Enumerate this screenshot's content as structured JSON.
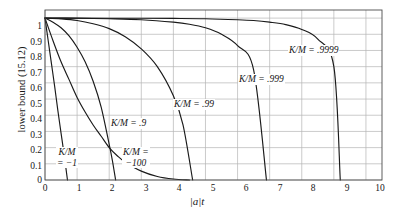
{
  "chart_data": {
    "type": "line",
    "title": "",
    "xlabel": "|a|t",
    "ylabel": "lower bound (15.12)",
    "xlim": [
      0,
      10.5
    ],
    "ylim": [
      0,
      1.05
    ],
    "xticks": [
      "0",
      "1",
      "2",
      "3",
      "4",
      "5",
      "6",
      "7",
      "8",
      "9",
      "10"
    ],
    "yticks": [
      "0",
      "0.1",
      "0.2",
      "0.3",
      "0.4",
      "0.5",
      "0.6",
      "0.7",
      "0.8",
      "0.9",
      "1"
    ],
    "grid": true,
    "legend_position": "inline-annotations",
    "series": [
      {
        "name": "K/M = -1",
        "label_text": "K/M",
        "label_text2": "= −1",
        "ratio": -1,
        "x": [
          0,
          0.1,
          0.2,
          0.3,
          0.4,
          0.5,
          0.6,
          0.7
        ],
        "values": [
          1.0,
          0.86,
          0.72,
          0.58,
          0.43,
          0.29,
          0.15,
          0.0
        ]
      },
      {
        "name": "K/M = -100",
        "label_text": "K/M =",
        "label_text2": "−100",
        "ratio": -100,
        "x": [
          0,
          0.25,
          0.5,
          0.75,
          1.0,
          1.25,
          1.5,
          1.75,
          2.0,
          2.25,
          2.5,
          3.0,
          3.5,
          4.0,
          4.5
        ],
        "values": [
          1.0,
          0.86,
          0.73,
          0.62,
          0.51,
          0.42,
          0.34,
          0.27,
          0.2,
          0.15,
          0.11,
          0.055,
          0.022,
          0.006,
          0.0
        ]
      },
      {
        "name": "K/M = .9",
        "label_text": "K/M = .9",
        "ratio": 0.9,
        "x": [
          0,
          0.25,
          0.5,
          0.75,
          1.0,
          1.25,
          1.5,
          1.75,
          2.0,
          2.1,
          2.2
        ],
        "values": [
          1.0,
          0.975,
          0.94,
          0.89,
          0.82,
          0.73,
          0.61,
          0.45,
          0.22,
          0.12,
          0.0
        ]
      },
      {
        "name": "K/M = .99",
        "label_text": "K/M = .99",
        "ratio": 0.99,
        "x": [
          0,
          0.5,
          1.0,
          1.5,
          2.0,
          2.5,
          3.0,
          3.5,
          4.0,
          4.3,
          4.6
        ],
        "values": [
          1.0,
          0.995,
          0.985,
          0.965,
          0.935,
          0.885,
          0.81,
          0.7,
          0.52,
          0.34,
          0.0
        ]
      },
      {
        "name": "K/M = .999",
        "label_text": "K/M = .999",
        "ratio": 0.999,
        "x": [
          0,
          1.0,
          2.0,
          3.0,
          4.0,
          4.5,
          5.0,
          5.5,
          6.0,
          6.5,
          6.9
        ],
        "values": [
          1.0,
          0.999,
          0.996,
          0.99,
          0.975,
          0.962,
          0.94,
          0.9,
          0.83,
          0.68,
          0.0
        ]
      },
      {
        "name": "K/M = .9999",
        "label_text": "K/M = .9999",
        "ratio": 0.9999,
        "x": [
          0,
          1.0,
          2.0,
          3.0,
          4.0,
          5.0,
          6.0,
          6.5,
          7.0,
          7.5,
          8.0,
          8.5,
          9.0,
          9.2
        ],
        "values": [
          1.0,
          1.0,
          0.999,
          0.999,
          0.998,
          0.996,
          0.99,
          0.985,
          0.975,
          0.96,
          0.93,
          0.87,
          0.7,
          0.0
        ]
      }
    ],
    "colors": {
      "curve": "#1a1a1a",
      "grid": "#b4b4b4",
      "axis": "#4d4d4d",
      "background": "#ffffff"
    }
  }
}
